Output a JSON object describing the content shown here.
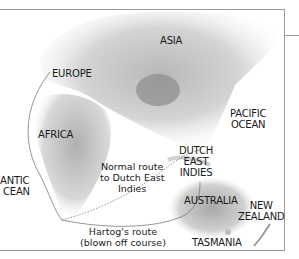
{
  "map": {
    "regions": {
      "asia": "ASIA",
      "europe": "EUROPE",
      "africa": "AFRICA",
      "pacific_ocean_1": "PACIFIC",
      "pacific_ocean_2": "OCEAN",
      "atlantic_1": "ANTIC",
      "atlantic_2": "CEAN",
      "dutch_east_indies_1": "DUTCH",
      "dutch_east_indies_2": "EAST",
      "dutch_east_indies_3": "INDIES",
      "australia": "AUSTRALIA",
      "new_zealand_1": "NEW",
      "new_zealand_2": "ZEALAND",
      "tasmania": "TASMANIA"
    },
    "routes": {
      "normal_1": "Normal route",
      "normal_2": "to Dutch East",
      "normal_3": "Indies",
      "hartog_1": "Hartog's route",
      "hartog_2": "(blown off course)"
    },
    "colors": {
      "land_light": "#f2f2f2",
      "land_mid": "#c8c8c8",
      "land_dark": "#8c8c8c",
      "route_line": "#7a7a7a",
      "frame": "#9a9a9a"
    }
  }
}
